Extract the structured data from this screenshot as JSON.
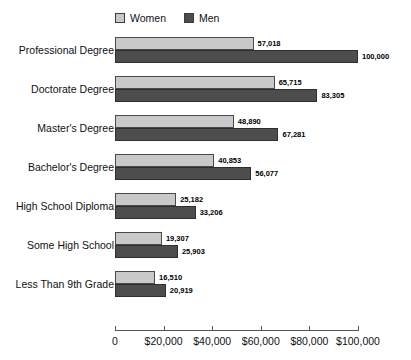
{
  "chart_data": {
    "type": "bar",
    "orientation": "horizontal",
    "title": "",
    "xlabel": "",
    "ylabel": "",
    "xlim": [
      0,
      100000
    ],
    "grid": false,
    "legend_position": "top",
    "tick_labels": [
      "0",
      "$20,000",
      "$40,000",
      "$60,000",
      "$80,000",
      "$100,000"
    ],
    "tick_values": [
      0,
      20000,
      40000,
      60000,
      80000,
      100000
    ],
    "categories": [
      "Professional Degree",
      "Doctorate Degree",
      "Master's Degree",
      "Bachelor's Degree",
      "High School Diploma",
      "Some High School",
      "Less Than 9th Grade"
    ],
    "series": [
      {
        "name": "Women",
        "color": "#c9c9c9",
        "values": [
          57018,
          65715,
          48890,
          40853,
          25182,
          19307,
          16510
        ],
        "value_labels": [
          "57,018",
          "65,715",
          "48,890",
          "40,853",
          "25,182",
          "19,307",
          "16,510"
        ]
      },
      {
        "name": "Men",
        "color": "#4d4d4d",
        "values": [
          100000,
          83305,
          67281,
          56077,
          33206,
          25903,
          20919
        ],
        "value_labels": [
          "100,000",
          "83,305",
          "67,281",
          "56,077",
          "33,206",
          "25,903",
          "20,919"
        ]
      }
    ]
  },
  "legend": {
    "entries": [
      {
        "label": "Women",
        "swatch": "legend-swatch-women"
      },
      {
        "label": "Men",
        "swatch": "legend-swatch-men"
      }
    ]
  }
}
